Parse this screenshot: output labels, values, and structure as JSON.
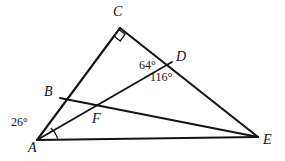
{
  "figure": {
    "background_color": "#ffffff",
    "stroke_color": "#141414",
    "vertices": [
      {
        "name": "A",
        "label": "A",
        "x": 37,
        "y": 140,
        "label_x": 28,
        "label_y": 141
      },
      {
        "name": "B",
        "label": "B",
        "x": 60,
        "y": 98,
        "label_x": 44,
        "label_y": 85
      },
      {
        "name": "C",
        "label": "C",
        "x": 120,
        "y": 28,
        "label_x": 113,
        "label_y": 5
      },
      {
        "name": "D",
        "label": "D",
        "x": 172,
        "y": 62,
        "label_x": 176,
        "label_y": 50
      },
      {
        "name": "E",
        "label": "E",
        "x": 258,
        "y": 137,
        "label_x": 263,
        "label_y": 133
      },
      {
        "name": "F",
        "label": "F",
        "x": 97,
        "y": 106,
        "label_x": 92,
        "label_y": 112
      }
    ],
    "segments": [
      {
        "name": "segment-A-C",
        "from": "A",
        "to": "C"
      },
      {
        "name": "segment-C-E",
        "from": "C",
        "to": "E"
      },
      {
        "name": "segment-A-E",
        "from": "A",
        "to": "E"
      },
      {
        "name": "segment-A-D",
        "from": "A",
        "to": "D"
      },
      {
        "name": "segment-B-E",
        "from": "B",
        "to": "E"
      }
    ],
    "angles": [
      {
        "name": "angle-at-A",
        "text": "26°",
        "value": 26,
        "vertex": "A",
        "label_x": 11,
        "label_y": 116,
        "marker": "arc"
      },
      {
        "name": "angle-CDA",
        "text": "64°",
        "value": 64,
        "vertex": "D",
        "label_x": 139,
        "label_y": 59,
        "marker": "none"
      },
      {
        "name": "angle-ADE",
        "text": "116°",
        "value": 116,
        "vertex": "D",
        "label_x": 150,
        "label_y": 71,
        "marker": "none"
      }
    ],
    "right_angle": {
      "name": "right-angle-marker-at-C",
      "vertex": "C",
      "value": 90,
      "marker": "square"
    }
  }
}
